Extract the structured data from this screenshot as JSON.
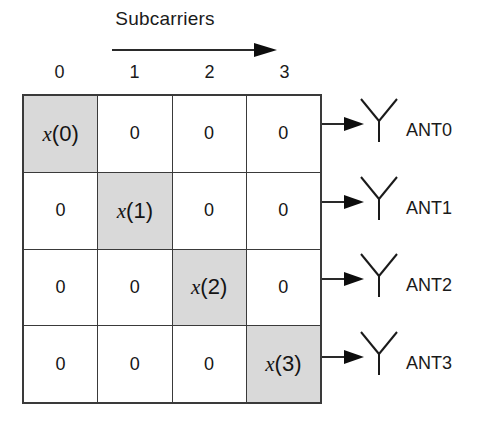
{
  "figure": {
    "title": "Subcarriers",
    "direction_arrow_icon": "right-arrow-icon"
  },
  "grid": {
    "column_headers": [
      "0",
      "1",
      "2",
      "3"
    ],
    "rows": [
      {
        "cells": [
          {
            "text": "x(0)",
            "symbol": true,
            "var": "x",
            "index": "(0)",
            "shaded": true
          },
          {
            "text": "0",
            "symbol": false,
            "shaded": false
          },
          {
            "text": "0",
            "symbol": false,
            "shaded": false
          },
          {
            "text": "0",
            "symbol": false,
            "shaded": false
          }
        ]
      },
      {
        "cells": [
          {
            "text": "0",
            "symbol": false,
            "shaded": false
          },
          {
            "text": "x(1)",
            "symbol": true,
            "var": "x",
            "index": "(1)",
            "shaded": true
          },
          {
            "text": "0",
            "symbol": false,
            "shaded": false
          },
          {
            "text": "0",
            "symbol": false,
            "shaded": false
          }
        ]
      },
      {
        "cells": [
          {
            "text": "0",
            "symbol": false,
            "shaded": false
          },
          {
            "text": "0",
            "symbol": false,
            "shaded": false
          },
          {
            "text": "x(2)",
            "symbol": true,
            "var": "x",
            "index": "(2)",
            "shaded": true
          },
          {
            "text": "0",
            "symbol": false,
            "shaded": false
          }
        ]
      },
      {
        "cells": [
          {
            "text": "0",
            "symbol": false,
            "shaded": false
          },
          {
            "text": "0",
            "symbol": false,
            "shaded": false
          },
          {
            "text": "0",
            "symbol": false,
            "shaded": false
          },
          {
            "text": "x(3)",
            "symbol": true,
            "var": "x",
            "index": "(3)",
            "shaded": true
          }
        ]
      }
    ]
  },
  "antennas": [
    {
      "label": "ANT0",
      "icon": "antenna-icon",
      "arrow_icon": "right-arrow-icon"
    },
    {
      "label": "ANT1",
      "icon": "antenna-icon",
      "arrow_icon": "right-arrow-icon"
    },
    {
      "label": "ANT2",
      "icon": "antenna-icon",
      "arrow_icon": "right-arrow-icon"
    },
    {
      "label": "ANT3",
      "icon": "antenna-icon",
      "arrow_icon": "right-arrow-icon"
    }
  ],
  "colors": {
    "shaded_cell": "#d9d9d9",
    "line": "#3a3a3a",
    "text": "#1a1a1a",
    "background": "#ffffff"
  }
}
